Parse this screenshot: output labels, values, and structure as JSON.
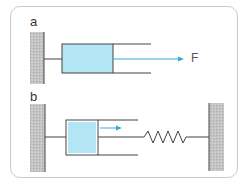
{
  "figure": {
    "panels": [
      {
        "label": "a",
        "force_label": "F",
        "description": "Piston in cylinder attached to fixed wall, pulled by force F"
      },
      {
        "label": "b",
        "description": "Piston in cylinder between fixed wall and spring attached to second wall"
      }
    ],
    "colors": {
      "piston_fill": "#b3e5f5",
      "arrow": "#3aa9d6",
      "wall": "#bdbdbd",
      "line": "#444444",
      "frame": "#c8c8c8"
    }
  }
}
